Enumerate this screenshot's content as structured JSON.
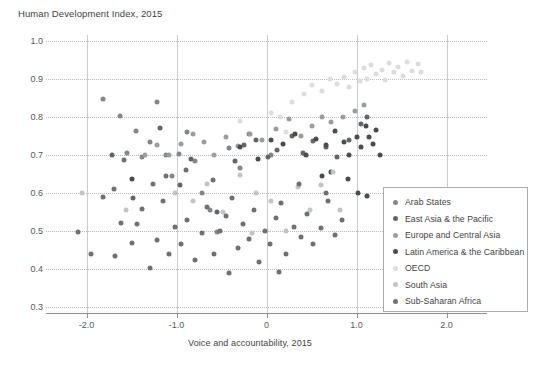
{
  "chart_data": {
    "type": "scatter",
    "title": "Human Development Index, 2015",
    "xlabel": "Voice and accountability, 2015",
    "ylabel": "Human Development Index, 2015",
    "xlim": [
      -2.45,
      2.45
    ],
    "ylim": [
      0.285,
      1.015
    ],
    "xticks": [
      "-2.0",
      "-1.0",
      "0",
      "1.0",
      "2.0"
    ],
    "xtick_values": [
      -2.0,
      -1.0,
      0,
      1.0,
      2.0
    ],
    "yticks": [
      "1.0",
      "0.9",
      "0.8",
      "0.7",
      "0.6",
      "0.5",
      "0.4",
      "0.3"
    ],
    "ytick_values": [
      1.0,
      0.9,
      0.8,
      0.7,
      0.6,
      0.5,
      0.4,
      0.3
    ],
    "grid": "horizontal-dotted-and-vertical-solid",
    "legend_position": "bottom-right-inside",
    "series": [
      {
        "name": "Arab States",
        "color": "#848789",
        "points": [
          [
            -1.82,
            0.847
          ],
          [
            -1.63,
            0.803
          ],
          [
            -1.55,
            0.706
          ],
          [
            -1.45,
            0.762
          ],
          [
            -1.38,
            0.694
          ],
          [
            -1.3,
            0.735
          ],
          [
            -1.22,
            0.84
          ],
          [
            -1.12,
            0.699
          ],
          [
            -1.05,
            0.644
          ],
          [
            -0.97,
            0.702
          ],
          [
            -0.88,
            0.759
          ],
          [
            -0.8,
            0.683
          ],
          [
            -0.72,
            0.6
          ],
          [
            -0.63,
            0.556
          ],
          [
            -0.55,
            0.497
          ],
          [
            -0.42,
            0.718
          ],
          [
            -0.3,
            0.666
          ],
          [
            -0.2,
            0.756
          ],
          [
            0.05,
            0.7
          ]
        ]
      },
      {
        "name": "East Asia & the Pacific",
        "color": "#636669",
        "points": [
          [
            -1.72,
            0.7
          ],
          [
            -1.48,
            0.586
          ],
          [
            -1.18,
            0.772
          ],
          [
            -0.96,
            0.621
          ],
          [
            -0.84,
            0.689
          ],
          [
            -0.55,
            0.55
          ],
          [
            -0.35,
            0.684
          ],
          [
            -0.25,
            0.726
          ],
          [
            -0.12,
            0.74
          ],
          [
            0.02,
            0.694
          ],
          [
            0.12,
            0.713
          ],
          [
            0.28,
            0.751
          ],
          [
            0.4,
            0.705
          ],
          [
            0.52,
            0.737
          ],
          [
            0.66,
            0.72
          ],
          [
            0.78,
            0.694
          ],
          [
            0.92,
            0.74
          ],
          [
            1.05,
            0.78
          ],
          [
            1.12,
            0.8
          ]
        ]
      },
      {
        "name": "Europe and Central Asia",
        "color": "#9b9ea0",
        "points": [
          [
            -1.35,
            0.7
          ],
          [
            -1.22,
            0.725
          ],
          [
            -1.08,
            0.699
          ],
          [
            -0.95,
            0.73
          ],
          [
            -0.82,
            0.756
          ],
          [
            -0.7,
            0.735
          ],
          [
            -0.58,
            0.7
          ],
          [
            -0.45,
            0.748
          ],
          [
            -0.32,
            0.724
          ],
          [
            -0.18,
            0.756
          ],
          [
            -0.05,
            0.74
          ],
          [
            0.1,
            0.768
          ],
          [
            0.25,
            0.795
          ],
          [
            0.38,
            0.75
          ],
          [
            0.5,
            0.776
          ],
          [
            0.62,
            0.8
          ],
          [
            0.72,
            0.786
          ],
          [
            0.85,
            0.8
          ],
          [
            0.98,
            0.815
          ],
          [
            1.08,
            0.83
          ]
        ]
      },
      {
        "name": "Latin America & the Caribbean",
        "color": "#4a4d50",
        "points": [
          [
            -1.5,
            0.636
          ],
          [
            -0.3,
            0.722
          ],
          [
            -0.1,
            0.69
          ],
          [
            0.05,
            0.74
          ],
          [
            0.18,
            0.728
          ],
          [
            0.32,
            0.755
          ],
          [
            0.44,
            0.7
          ],
          [
            0.55,
            0.741
          ],
          [
            0.66,
            0.727
          ],
          [
            0.76,
            0.762
          ],
          [
            0.86,
            0.735
          ],
          [
            0.92,
            0.7
          ],
          [
            1.0,
            0.747
          ],
          [
            1.05,
            0.72
          ],
          [
            1.1,
            0.775
          ],
          [
            1.14,
            0.747
          ],
          [
            1.18,
            0.73
          ],
          [
            1.22,
            0.765
          ],
          [
            1.26,
            0.7
          ],
          [
            0.62,
            0.645
          ],
          [
            0.72,
            0.655
          ],
          [
            0.9,
            0.637
          ],
          [
            1.02,
            0.6
          ],
          [
            1.12,
            0.593
          ]
        ]
      },
      {
        "name": "OECD",
        "color": "#dcdddf",
        "points": [
          [
            0.28,
            0.84
          ],
          [
            0.42,
            0.86
          ],
          [
            0.5,
            0.885
          ],
          [
            0.62,
            0.868
          ],
          [
            0.7,
            0.9
          ],
          [
            0.78,
            0.887
          ],
          [
            0.86,
            0.905
          ],
          [
            0.92,
            0.878
          ],
          [
            0.98,
            0.917
          ],
          [
            1.04,
            0.893
          ],
          [
            1.08,
            0.928
          ],
          [
            1.12,
            0.9
          ],
          [
            1.16,
            0.935
          ],
          [
            1.22,
            0.913
          ],
          [
            1.28,
            0.924
          ],
          [
            1.32,
            0.896
          ],
          [
            1.36,
            0.941
          ],
          [
            1.42,
            0.918
          ],
          [
            1.46,
            0.93
          ],
          [
            1.52,
            0.907
          ],
          [
            1.56,
            0.944
          ],
          [
            1.62,
            0.92
          ],
          [
            1.68,
            0.938
          ],
          [
            1.72,
            0.918
          ],
          [
            0.22,
            0.76
          ],
          [
            0.15,
            0.8
          ],
          [
            0.05,
            0.81
          ],
          [
            -0.3,
            0.79
          ]
        ]
      },
      {
        "name": "South Asia",
        "color": "#c2c5c7",
        "points": [
          [
            -1.56,
            0.556
          ],
          [
            -1.02,
            0.6
          ],
          [
            -0.82,
            0.579
          ],
          [
            -0.66,
            0.624
          ],
          [
            -0.48,
            0.55
          ],
          [
            -0.3,
            0.648
          ],
          [
            -0.12,
            0.6
          ],
          [
            0.05,
            0.58
          ],
          [
            0.22,
            0.5
          ],
          [
            0.35,
            0.616
          ],
          [
            0.48,
            0.555
          ],
          [
            0.6,
            0.62
          ],
          [
            0.74,
            0.655
          ],
          [
            -2.05,
            0.6
          ],
          [
            -0.16,
            0.495
          ],
          [
            0.82,
            0.556
          ]
        ]
      },
      {
        "name": "Sub-Saharan Africa",
        "color": "#6e7174",
        "points": [
          [
            -2.1,
            0.497
          ],
          [
            -1.95,
            0.44
          ],
          [
            -1.82,
            0.59
          ],
          [
            -1.68,
            0.435
          ],
          [
            -1.62,
            0.522
          ],
          [
            -1.5,
            0.468
          ],
          [
            -1.44,
            0.52
          ],
          [
            -1.38,
            0.557
          ],
          [
            -1.3,
            0.404
          ],
          [
            -1.22,
            0.478
          ],
          [
            -1.15,
            0.58
          ],
          [
            -1.08,
            0.44
          ],
          [
            -1.02,
            0.51
          ],
          [
            -0.95,
            0.466
          ],
          [
            -0.88,
            0.53
          ],
          [
            -0.8,
            0.424
          ],
          [
            -0.72,
            0.495
          ],
          [
            -0.66,
            0.563
          ],
          [
            -0.58,
            0.44
          ],
          [
            -0.52,
            0.5
          ],
          [
            -0.45,
            0.54
          ],
          [
            -0.38,
            0.586
          ],
          [
            -0.32,
            0.455
          ],
          [
            -0.26,
            0.52
          ],
          [
            -0.2,
            0.48
          ],
          [
            -0.14,
            0.555
          ],
          [
            -0.08,
            0.42
          ],
          [
            -0.02,
            0.5
          ],
          [
            0.04,
            0.466
          ],
          [
            0.1,
            0.535
          ],
          [
            0.16,
            0.575
          ],
          [
            0.22,
            0.44
          ],
          [
            0.3,
            0.51
          ],
          [
            0.38,
            0.485
          ],
          [
            0.45,
            0.545
          ],
          [
            0.52,
            0.466
          ],
          [
            0.6,
            0.508
          ],
          [
            0.68,
            0.58
          ],
          [
            0.76,
            0.49
          ],
          [
            0.84,
            0.53
          ],
          [
            -0.42,
            0.39
          ],
          [
            0.14,
            0.392
          ],
          [
            -1.7,
            0.61
          ],
          [
            -1.26,
            0.625
          ],
          [
            -0.9,
            0.66
          ],
          [
            -0.6,
            0.635
          ],
          [
            0.36,
            0.625
          ],
          [
            0.66,
            0.6
          ],
          [
            -1.58,
            0.688
          ],
          [
            -1.12,
            0.645
          ]
        ]
      }
    ]
  },
  "legend": {
    "items": [
      {
        "label": "Arab States",
        "color": "#848789"
      },
      {
        "label": "East Asia & the Pacific",
        "color": "#636669"
      },
      {
        "label": "Europe and Central Asia",
        "color": "#9b9ea0"
      },
      {
        "label": "Latin America & the Caribbean",
        "color": "#4a4d50"
      },
      {
        "label": "OECD",
        "color": "#dcdddf"
      },
      {
        "label": "South Asia",
        "color": "#c2c5c7"
      },
      {
        "label": "Sub-Saharan Africa",
        "color": "#6e7174"
      }
    ]
  }
}
